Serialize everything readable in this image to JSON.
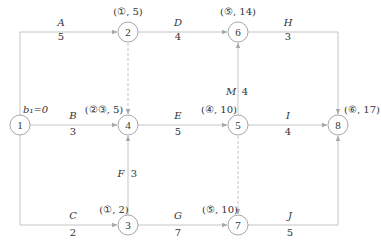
{
  "diagram": {
    "type": "activity-on-arrow network (double-code network)",
    "nodes": [
      {
        "id": "1",
        "x": 20,
        "y": 125,
        "annotation": "b₁=0"
      },
      {
        "id": "2",
        "x": 128,
        "y": 32,
        "annotation": "(①, 5)"
      },
      {
        "id": "3",
        "x": 128,
        "y": 225,
        "annotation": "(①, 2)"
      },
      {
        "id": "4",
        "x": 128,
        "y": 125,
        "annotation": "(②③, 5)"
      },
      {
        "id": "5",
        "x": 238,
        "y": 125,
        "annotation": "(④, 10)"
      },
      {
        "id": "6",
        "x": 238,
        "y": 32,
        "annotation": "(⑤, 14)"
      },
      {
        "id": "7",
        "x": 238,
        "y": 225,
        "annotation": "(⑤, 10)"
      },
      {
        "id": "8",
        "x": 338,
        "y": 125,
        "annotation": "(⑥, 17)"
      }
    ],
    "activities": [
      {
        "name": "A",
        "duration": "5",
        "from": "1",
        "to": "2"
      },
      {
        "name": "B",
        "duration": "3",
        "from": "1",
        "to": "4"
      },
      {
        "name": "C",
        "duration": "2",
        "from": "1",
        "to": "3"
      },
      {
        "name": "D",
        "duration": "4",
        "from": "2",
        "to": "6"
      },
      {
        "name": "E",
        "duration": "5",
        "from": "4",
        "to": "5"
      },
      {
        "name": "F",
        "duration": "3",
        "from": "3",
        "to": "4"
      },
      {
        "name": "G",
        "duration": "7",
        "from": "3",
        "to": "7"
      },
      {
        "name": "H",
        "duration": "3",
        "from": "6",
        "to": "8"
      },
      {
        "name": "I",
        "duration": "4",
        "from": "5",
        "to": "8"
      },
      {
        "name": "J",
        "duration": "5",
        "from": "7",
        "to": "8"
      },
      {
        "name": "M",
        "duration": "4",
        "from": "5",
        "to": "6"
      }
    ],
    "dummy_activities": [
      {
        "from": "2",
        "to": "4"
      },
      {
        "from": "5",
        "to": "7"
      }
    ],
    "colors": {
      "line": "#bdbdbd",
      "text": "#333333",
      "node_stroke": "#9e9e9e"
    }
  }
}
